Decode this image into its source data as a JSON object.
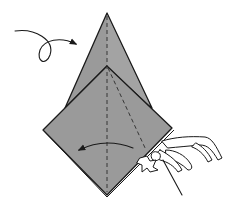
{
  "diagram": {
    "type": "origami-instruction-step",
    "description": "Kite/diamond paper fold with turn-over arrow and a hand pulling a flap",
    "colors": {
      "paper": "#9a9a9a",
      "outline": "#1a1a1a",
      "background": "#ffffff"
    },
    "elements": {
      "turn_over_arrow": {
        "symbol": "loop-arrow",
        "meaning": "turn model over"
      },
      "fold_arrow": {
        "symbol": "curved-arrow-left",
        "meaning": "fold flap to the left"
      },
      "valley_fold_lines": [
        "vertical-center-line",
        "diagonal-inner-line"
      ],
      "hand": {
        "symbol": "hand-icon",
        "position": "lower-right"
      }
    },
    "geometry": {
      "top_apex": [
        107,
        13
      ],
      "inner_peak": [
        107,
        66
      ],
      "left_vertex": [
        43,
        130
      ],
      "right_vertex": [
        172,
        128
      ],
      "bottom_vertex": [
        107,
        195
      ]
    }
  }
}
